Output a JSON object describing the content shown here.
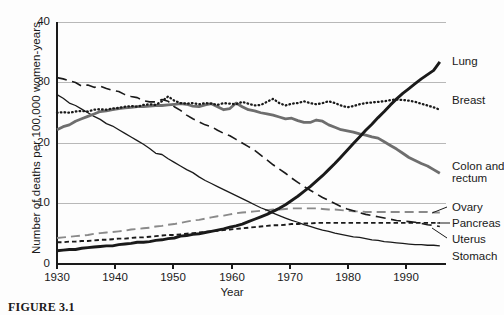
{
  "figure": {
    "caption": "FIGURE 3.1"
  },
  "chart_data": {
    "type": "line",
    "title": "",
    "xlabel": "Year",
    "ylabel": "Number of deaths per 100,000 women-years",
    "xlim": [
      1930,
      1993
    ],
    "ylim": [
      0,
      40
    ],
    "xticks": [
      1930,
      1940,
      1950,
      1960,
      1970,
      1980,
      1990
    ],
    "yticks": [
      0,
      10,
      20,
      30,
      40
    ],
    "grid": "horizontal",
    "legend_position": "right-inline",
    "x": [
      1930,
      1931,
      1932,
      1933,
      1934,
      1935,
      1936,
      1937,
      1938,
      1939,
      1940,
      1941,
      1942,
      1943,
      1944,
      1945,
      1946,
      1947,
      1948,
      1949,
      1950,
      1951,
      1952,
      1953,
      1954,
      1955,
      1956,
      1957,
      1958,
      1959,
      1960,
      1961,
      1962,
      1963,
      1964,
      1965,
      1966,
      1967,
      1968,
      1969,
      1970,
      1971,
      1972,
      1973,
      1974,
      1975,
      1976,
      1977,
      1978,
      1979,
      1980,
      1981,
      1982,
      1983,
      1984,
      1985,
      1986,
      1987,
      1988,
      1989,
      1990,
      1991,
      1992
    ],
    "series": [
      {
        "name": "Lung",
        "label": "Lung",
        "style": "solid-thick-black",
        "color": "#1a1a1a",
        "values": [
          2.2,
          2.3,
          2.4,
          2.4,
          2.6,
          2.7,
          2.8,
          2.9,
          3.0,
          3.0,
          3.2,
          3.3,
          3.4,
          3.6,
          3.6,
          3.7,
          3.9,
          4.0,
          4.2,
          4.3,
          4.6,
          4.7,
          4.9,
          5.0,
          5.2,
          5.4,
          5.6,
          5.8,
          6.1,
          6.3,
          6.6,
          7.0,
          7.4,
          7.8,
          8.2,
          8.7,
          9.2,
          9.8,
          10.5,
          11.2,
          12.0,
          12.8,
          13.7,
          14.6,
          15.6,
          16.6,
          17.7,
          18.8,
          19.9,
          21.0,
          22.1,
          23.1,
          24.2,
          25.2,
          26.3,
          27.3,
          28.2,
          29.0,
          29.8,
          30.6,
          31.3,
          32.0,
          33.4
        ],
        "end_value": 33.4
      },
      {
        "name": "Breast",
        "label": "Breast",
        "style": "dotted-black",
        "color": "#1a1a1a",
        "values": [
          25.0,
          25.1,
          25.0,
          25.2,
          25.3,
          25.2,
          25.5,
          25.6,
          25.5,
          25.7,
          25.8,
          26.0,
          26.1,
          26.0,
          26.3,
          26.4,
          26.3,
          26.9,
          27.7,
          27.0,
          26.6,
          26.5,
          26.6,
          26.4,
          26.6,
          26.5,
          26.3,
          26.6,
          26.5,
          26.4,
          26.8,
          26.5,
          26.2,
          26.3,
          26.8,
          27.3,
          26.6,
          26.2,
          26.5,
          26.6,
          26.9,
          26.6,
          26.4,
          26.6,
          26.9,
          26.6,
          26.2,
          25.9,
          26.1,
          26.4,
          26.6,
          26.7,
          26.8,
          26.9,
          27.1,
          27.2,
          27.1,
          27.0,
          26.8,
          26.5,
          26.2,
          25.9,
          25.5
        ],
        "end_value": 25.5
      },
      {
        "name": "Colon and rectum",
        "label": "Colon and\nrectum",
        "style": "solid-thick-gray",
        "color": "#6e6e6e",
        "values": [
          22.2,
          22.7,
          23.0,
          23.6,
          24.0,
          24.4,
          24.8,
          25.2,
          25.3,
          25.5,
          25.7,
          25.8,
          25.9,
          26.0,
          26.0,
          26.1,
          26.2,
          26.2,
          26.3,
          26.4,
          26.5,
          26.4,
          26.1,
          26.0,
          26.3,
          26.5,
          26.0,
          25.5,
          25.7,
          26.6,
          26.0,
          25.5,
          25.3,
          25.0,
          24.8,
          24.6,
          24.3,
          24.0,
          24.1,
          23.7,
          23.4,
          23.4,
          23.8,
          23.6,
          23.0,
          22.6,
          22.2,
          22.0,
          21.8,
          21.5,
          21.3,
          21.0,
          20.8,
          20.2,
          19.6,
          19.0,
          18.3,
          17.6,
          17.1,
          16.6,
          16.2,
          15.6,
          15.0
        ],
        "end_value": 15.0
      },
      {
        "name": "Uterus",
        "label": "Uterus",
        "style": "dashed-long-black",
        "color": "#1a1a1a",
        "values": [
          30.8,
          30.6,
          30.3,
          30.0,
          29.4,
          29.6,
          29.2,
          29.4,
          29.0,
          28.7,
          28.5,
          28.0,
          27.7,
          27.5,
          27.0,
          26.8,
          26.8,
          27.2,
          26.9,
          26.0,
          25.4,
          24.6,
          24.0,
          23.5,
          23.0,
          22.7,
          22.1,
          21.6,
          21.2,
          20.6,
          20.0,
          19.4,
          18.8,
          18.0,
          17.2,
          16.4,
          15.7,
          15.0,
          14.2,
          13.5,
          12.8,
          12.2,
          11.6,
          11.0,
          10.5,
          10.0,
          9.5,
          9.1,
          8.8,
          8.5,
          8.2,
          8.0,
          7.8,
          7.6,
          7.4,
          7.2,
          7.1,
          7.0,
          6.9,
          6.7,
          6.5,
          6.4,
          6.2
        ],
        "end_value": 6.2
      },
      {
        "name": "Stomach",
        "label": "Stomach",
        "style": "solid-thin-black",
        "color": "#1a1a1a",
        "values": [
          28.0,
          27.4,
          26.6,
          26.2,
          25.6,
          25.0,
          24.4,
          23.9,
          23.2,
          22.8,
          22.2,
          21.6,
          21.0,
          20.4,
          19.8,
          19.1,
          18.3,
          18.1,
          17.4,
          16.8,
          16.2,
          15.6,
          15.1,
          14.4,
          13.8,
          13.3,
          12.8,
          12.3,
          11.8,
          11.3,
          10.8,
          10.3,
          9.8,
          9.3,
          8.9,
          8.4,
          8.0,
          7.6,
          7.2,
          6.9,
          6.5,
          6.2,
          5.9,
          5.6,
          5.4,
          5.1,
          4.9,
          4.7,
          4.5,
          4.4,
          4.2,
          4.0,
          3.9,
          3.7,
          3.6,
          3.5,
          3.4,
          3.3,
          3.2,
          3.2,
          3.1,
          3.1,
          3.0
        ],
        "end_value": 3.0
      },
      {
        "name": "Ovary",
        "label": "Ovary",
        "style": "dashed-medium-gray",
        "color": "#8a8a8a",
        "values": [
          4.3,
          4.4,
          4.5,
          4.6,
          4.7,
          4.8,
          5.0,
          5.1,
          5.2,
          5.3,
          5.4,
          5.5,
          5.7,
          5.8,
          5.9,
          6.0,
          6.2,
          6.3,
          6.5,
          6.6,
          6.8,
          7.0,
          7.2,
          7.3,
          7.5,
          7.7,
          7.9,
          8.0,
          8.2,
          8.4,
          8.5,
          8.6,
          8.7,
          8.8,
          8.9,
          9.0,
          9.0,
          9.1,
          9.2,
          9.2,
          9.2,
          9.2,
          9.2,
          9.1,
          9.0,
          9.0,
          8.9,
          8.8,
          8.7,
          8.7,
          8.6,
          8.6,
          8.6,
          8.6,
          8.6,
          8.6,
          8.6,
          8.6,
          8.6,
          8.6,
          8.6,
          8.5,
          8.5
        ],
        "end_value": 8.5
      },
      {
        "name": "Pancreas",
        "label": "Pancreas",
        "style": "dotted-dash-black",
        "color": "#1a1a1a",
        "values": [
          3.6,
          3.6,
          3.7,
          3.7,
          3.8,
          3.8,
          3.9,
          4.0,
          4.0,
          4.1,
          4.2,
          4.2,
          4.3,
          4.4,
          4.4,
          4.5,
          4.6,
          4.7,
          4.8,
          4.8,
          4.9,
          5.0,
          5.1,
          5.2,
          5.3,
          5.4,
          5.5,
          5.6,
          5.7,
          5.8,
          5.9,
          6.0,
          6.1,
          6.2,
          6.3,
          6.4,
          6.4,
          6.5,
          6.6,
          6.6,
          6.7,
          6.7,
          6.8,
          6.8,
          6.8,
          6.8,
          6.8,
          6.8,
          6.8,
          6.8,
          6.8,
          6.8,
          6.8,
          6.8,
          6.8,
          6.8,
          6.8,
          6.8,
          6.8,
          6.8,
          6.8,
          6.8,
          6.8
        ],
        "end_value": 6.8
      }
    ]
  },
  "labels": {
    "lung": "Lung",
    "breast": "Breast",
    "colon1": "Colon and",
    "colon2": "rectum",
    "ovary": "Ovary",
    "pancreas": "Pancreas",
    "uterus": "Uterus",
    "stomach": "Stomach",
    "y_axis": "Number of deaths per 100,000 women-years",
    "x_axis": "Year",
    "t1930": "1930",
    "t1940": "1940",
    "t1950": "1950",
    "t1960": "1960",
    "t1970": "1970",
    "t1980": "1980",
    "t1990": "1990",
    "y0": "0",
    "y10": "10",
    "y20": "20",
    "y30": "30",
    "y40": "40"
  }
}
